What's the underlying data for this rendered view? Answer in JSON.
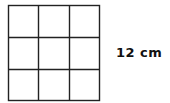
{
  "diagram": {
    "type": "square-grid",
    "rows": 3,
    "cols": 3,
    "line_color": "#222222",
    "background": "#ffffff",
    "side_label": "12 cm"
  }
}
